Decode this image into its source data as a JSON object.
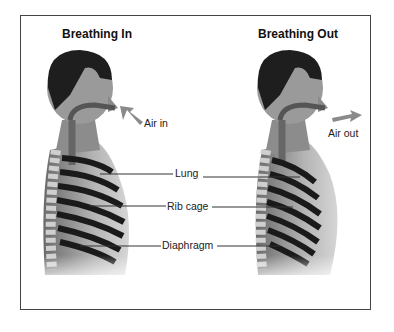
{
  "diagram": {
    "panels": [
      {
        "title": "Breathing In",
        "airflow_label": "Air in",
        "airflow_direction": "inward"
      },
      {
        "title": "Breathing Out",
        "airflow_label": "Air out",
        "airflow_direction": "outward"
      }
    ],
    "callouts": [
      "Lung",
      "Rib cage",
      "Diaphragm"
    ],
    "colors": {
      "frame": "#444444",
      "hair": "#1e1e1e",
      "skin_dark": "#5a5a5a",
      "skin_light": "#d8d8d8",
      "rib_dark": "#1a1a1a",
      "rib_light": "#f2f2f2",
      "arrow": "#8a8a8a",
      "leader_line": "#333333"
    }
  }
}
